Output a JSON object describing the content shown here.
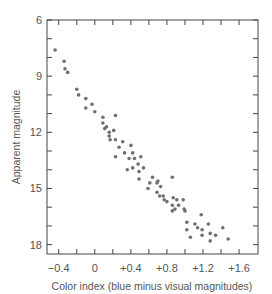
{
  "chart_data": {
    "type": "scatter",
    "title": "",
    "xlabel": "Color index (blue minus visual magnitudes)",
    "ylabel": "Apparent magnitude",
    "xlim": [
      -0.53,
      1.81
    ],
    "ylim": [
      18.5,
      6
    ],
    "y_inverted": true,
    "grid": false,
    "legend": null,
    "x_ticks": [
      -0.4,
      -0.2,
      0,
      0.2,
      0.4,
      0.6,
      0.8,
      1.0,
      1.2,
      1.4,
      1.6
    ],
    "x_tick_labels": [
      "−0.4",
      "0",
      "+0.4",
      "+0.8",
      "+1.2",
      "+1.6"
    ],
    "x_tick_label_values": [
      -0.4,
      0,
      0.4,
      0.8,
      1.2,
      1.6
    ],
    "y_ticks": [
      6,
      7,
      8,
      9,
      10,
      11,
      12,
      13,
      14,
      15,
      16,
      17,
      18
    ],
    "y_tick_labels": [
      "6",
      "9",
      "12",
      "15",
      "18"
    ],
    "y_tick_label_values": [
      6,
      9,
      12,
      15,
      18
    ],
    "series": [
      {
        "name": "stars",
        "points": [
          [
            -0.44,
            7.6
          ],
          [
            -0.34,
            8.2
          ],
          [
            -0.33,
            8.6
          ],
          [
            -0.3,
            8.8
          ],
          [
            -0.2,
            9.7
          ],
          [
            -0.18,
            10.0
          ],
          [
            -0.1,
            10.2
          ],
          [
            -0.03,
            10.5
          ],
          [
            -0.1,
            10.7
          ],
          [
            0.0,
            10.9
          ],
          [
            0.09,
            11.2
          ],
          [
            0.23,
            11.1
          ],
          [
            0.09,
            11.5
          ],
          [
            0.13,
            11.7
          ],
          [
            0.11,
            11.8
          ],
          [
            0.21,
            11.9
          ],
          [
            0.16,
            12.0
          ],
          [
            0.16,
            12.2
          ],
          [
            0.17,
            12.4
          ],
          [
            0.23,
            12.4
          ],
          [
            0.31,
            12.5
          ],
          [
            0.4,
            12.7
          ],
          [
            0.27,
            12.8
          ],
          [
            0.33,
            13.1
          ],
          [
            0.42,
            13.1
          ],
          [
            0.23,
            13.3
          ],
          [
            0.38,
            13.4
          ],
          [
            0.44,
            13.4
          ],
          [
            0.51,
            13.3
          ],
          [
            0.48,
            13.7
          ],
          [
            0.42,
            13.9
          ],
          [
            0.36,
            14.0
          ],
          [
            0.54,
            13.9
          ],
          [
            0.49,
            14.1
          ],
          [
            0.64,
            14.4
          ],
          [
            0.49,
            14.5
          ],
          [
            0.61,
            14.7
          ],
          [
            0.69,
            14.7
          ],
          [
            0.86,
            14.4
          ],
          [
            0.59,
            15.0
          ],
          [
            0.73,
            14.9
          ],
          [
            0.7,
            14.6
          ],
          [
            0.69,
            15.2
          ],
          [
            0.72,
            15.4
          ],
          [
            0.76,
            15.4
          ],
          [
            0.77,
            15.6
          ],
          [
            0.8,
            15.7
          ],
          [
            0.87,
            15.5
          ],
          [
            0.91,
            15.6
          ],
          [
            0.98,
            15.6
          ],
          [
            0.86,
            15.9
          ],
          [
            0.93,
            15.9
          ],
          [
            0.89,
            16.1
          ],
          [
            0.86,
            16.2
          ],
          [
            0.99,
            16.1
          ],
          [
            1.0,
            16.2
          ],
          [
            1.18,
            16.4
          ],
          [
            1.02,
            16.8
          ],
          [
            1.11,
            16.9
          ],
          [
            1.14,
            17.1
          ],
          [
            1.26,
            16.9
          ],
          [
            1.02,
            17.2
          ],
          [
            1.19,
            17.2
          ],
          [
            1.19,
            17.5
          ],
          [
            1.06,
            17.6
          ],
          [
            1.28,
            17.4
          ],
          [
            1.34,
            17.5
          ],
          [
            1.28,
            17.8
          ],
          [
            1.42,
            17.1
          ],
          [
            1.48,
            17.7
          ]
        ]
      }
    ],
    "marker": {
      "shape": "circle",
      "color": "#6f6f6f",
      "radius": 1.8
    }
  },
  "labels": {
    "xlabel": "Color index (blue minus visual magnitudes)",
    "ylabel": "Apparent magnitude",
    "x_ticks": [
      "−0.4",
      "0",
      "+0.4",
      "+0.8",
      "+1.2",
      "+1.6"
    ],
    "y_ticks": [
      "6",
      "9",
      "12",
      "15",
      "18"
    ]
  }
}
